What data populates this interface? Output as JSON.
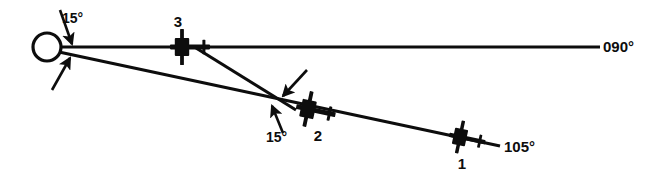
{
  "figure": {
    "type": "navigation-diagram",
    "background_color": "#ffffff",
    "stroke_color": "#0d0d0d"
  },
  "station": {
    "name": "station-circle",
    "cx": 47,
    "cy": 47,
    "r": 14,
    "stroke_width": 3.2
  },
  "radials": [
    {
      "name": "radial-090",
      "label": "090°",
      "from": [
        60,
        47
      ],
      "to": [
        600,
        47
      ],
      "stroke_width": 3.0,
      "label_x": 603,
      "label_y": 52
    },
    {
      "name": "radial-105",
      "label": "105°",
      "from": [
        59,
        52
      ],
      "to": [
        500,
        146
      ],
      "stroke_width": 3.2,
      "label_x": 504,
      "label_y": 152
    }
  ],
  "connector": {
    "name": "connector-line-3-to-2",
    "from": [
      196,
      48
    ],
    "to": [
      296,
      110
    ],
    "stroke_width": 3.2
  },
  "aircraft": [
    {
      "id": "aircraft-3",
      "label": "3",
      "x": 182,
      "y": 47,
      "rotation": 0,
      "scale": 1.0,
      "label_x": 178,
      "label_y": 27
    },
    {
      "id": "aircraft-2",
      "label": "2",
      "x": 308,
      "y": 109,
      "rotation": 12,
      "scale": 1.0,
      "label_x": 318,
      "label_y": 141
    },
    {
      "id": "aircraft-1",
      "label": "1",
      "x": 460,
      "y": 137,
      "rotation": 12,
      "scale": 0.92,
      "label_x": 462,
      "label_y": 169
    }
  ],
  "angle_labels": [
    {
      "name": "angle-label-station",
      "text": "15°",
      "x": 62,
      "y": 23
    },
    {
      "name": "angle-label-aircraft-2",
      "text": "15°",
      "x": 266,
      "y": 142
    }
  ],
  "angle_arrows": [
    {
      "name": "angle-arrow-station-upper",
      "from": [
        60,
        10
      ],
      "to": [
        72,
        44
      ],
      "stroke_width": 2.6
    },
    {
      "name": "angle-arrow-station-lower",
      "from": [
        52,
        90
      ],
      "to": [
        70,
        58
      ],
      "stroke_width": 2.6
    },
    {
      "name": "angle-arrow-aircraft2-upper",
      "from": [
        307,
        70
      ],
      "to": [
        283,
        96
      ],
      "stroke_width": 2.6
    },
    {
      "name": "angle-arrow-aircraft2-lower",
      "from": [
        283,
        133
      ],
      "to": [
        272,
        106
      ],
      "stroke_width": 2.6
    }
  ]
}
